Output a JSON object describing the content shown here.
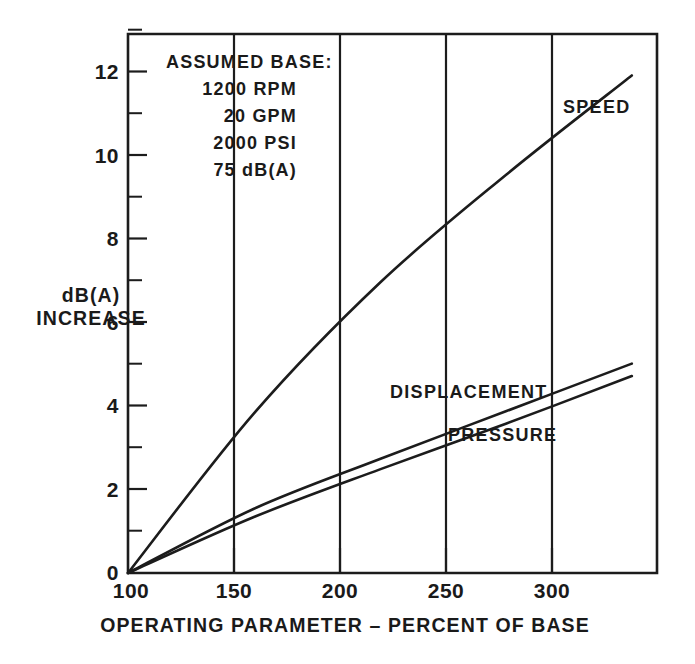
{
  "chart_data": {
    "type": "line",
    "title": "",
    "xlabel": "OPERATING PARAMETER – PERCENT OF BASE",
    "ylabel": "dB(A) INCREASE",
    "ylabel_line1": "dB(A)",
    "ylabel_line2": "INCREASE",
    "xlim": [
      100,
      310
    ],
    "ylim": [
      0,
      13
    ],
    "x_ticks": [
      100,
      150,
      200,
      250,
      300
    ],
    "x_tick_labels": [
      "100",
      "150",
      "200",
      "250",
      "300"
    ],
    "y_ticks": [
      0,
      2,
      4,
      6,
      8,
      10,
      12
    ],
    "y_tick_labels": [
      "0",
      "2",
      "4",
      "6",
      "8",
      "10",
      "12"
    ],
    "y_minor_ticks": [
      1,
      3,
      5,
      7,
      9,
      11,
      13
    ],
    "grid": "vertical-only",
    "legend": "inline-labels",
    "x": [
      100,
      150,
      200,
      250,
      300
    ],
    "series": [
      {
        "name": "SPEED",
        "values": [
          0,
          3.85,
          7.0,
          9.6,
          12.0
        ],
        "label_x": 300,
        "label_y": 12.0
      },
      {
        "name": "DISPLACEMENT",
        "values": [
          0,
          1.55,
          2.75,
          3.9,
          5.05
        ],
        "label_x": 250,
        "label_y": 5.05
      },
      {
        "name": "PRESSURE",
        "values": [
          0,
          1.35,
          2.5,
          3.6,
          4.75
        ],
        "label_x": 255,
        "label_y": 4.75
      }
    ],
    "annotation": {
      "title": "ASSUMED BASE:",
      "lines": [
        "1200 RPM",
        "20 GPM",
        "2000 PSI",
        "75 dB(A)"
      ]
    }
  }
}
